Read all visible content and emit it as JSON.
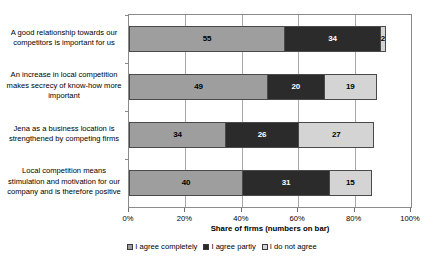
{
  "chart_data": {
    "type": "bar",
    "orientation": "horizontal",
    "stacked": true,
    "title": "",
    "xlabel": "Share of firms (numbers on bar)",
    "ylabel": "",
    "xlim": [
      0,
      100
    ],
    "xticks": [
      "0%",
      "20%",
      "40%",
      "60%",
      "80%",
      "100%"
    ],
    "xtick_values": [
      0,
      20,
      40,
      60,
      80,
      100
    ],
    "grid": true,
    "legend_position": "bottom",
    "categories": [
      "A good relationship towards our competitors is important for us",
      "An increase in local competition makes secrecy of know-how more important",
      "Jena as a business location is strengthened by competing firms",
      "Local competition means stimulation and motivation for our company and is therefore positive"
    ],
    "series": [
      {
        "name": "I agree completely",
        "color": "#9e9e9e",
        "values": [
          55,
          49,
          34,
          40
        ]
      },
      {
        "name": "I agree partly",
        "color": "#2b2b2b",
        "values": [
          34,
          20,
          26,
          31
        ]
      },
      {
        "name": "I do not agree",
        "color": "#d4d4d4",
        "values": [
          2,
          19,
          27,
          15
        ]
      }
    ]
  }
}
